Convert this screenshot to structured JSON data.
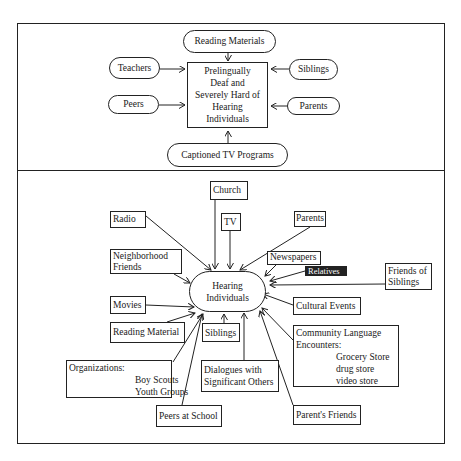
{
  "top_panel": {
    "center": [
      "Prelingually",
      "Deaf and",
      "Severely Hard of",
      "Hearing",
      "Individuals"
    ],
    "reading_materials": "Reading Materials",
    "teachers": "Teachers",
    "peers": "Peers",
    "siblings": "Siblings",
    "parents": "Parents",
    "captioned_tv": "Captioned TV Programs"
  },
  "bottom_panel": {
    "center": [
      "Hearing",
      "Individuals"
    ],
    "church": "Church",
    "radio": "Radio",
    "tv": "TV",
    "parents": "Parents",
    "neighborhood_friends": [
      "Neighborhood",
      "Friends"
    ],
    "newspapers": "Newspapers",
    "relatives": "Relatives",
    "friends_of_siblings": [
      "Friends of",
      "Siblings"
    ],
    "movies": "Movies",
    "cultural_events": "Cultural Events",
    "reading_material": "Reading Material",
    "siblings": "Siblings",
    "community": {
      "title": [
        "Community Language",
        "Encounters:"
      ],
      "items": [
        "Grocery Store",
        "drug store",
        "video store"
      ]
    },
    "organizations": {
      "title": "Organizations:",
      "items": [
        "Boy Scouts",
        "Youth Groups"
      ]
    },
    "dialogues": [
      "Dialogues with",
      "Significant Others"
    ],
    "peers_at_school": "Peers at School",
    "parents_friends": "Parent's Friends"
  }
}
